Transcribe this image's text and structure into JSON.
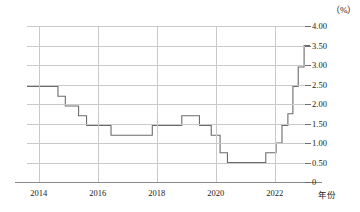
{
  "chart_data": {
    "type": "line",
    "title": "",
    "subtitle": "",
    "xlabel": "年份",
    "ylabel": "",
    "unit_label": "（%）",
    "grid": true,
    "legend": null,
    "line_style": "step",
    "xlim": [
      2013.6,
      2023.2
    ],
    "ylim": [
      0,
      4.0
    ],
    "xticks": [
      "2014",
      "2016",
      "2018",
      "2020",
      "2022"
    ],
    "xtick_values": [
      2014,
      2016,
      2018,
      2020,
      2022
    ],
    "yticks": [
      "0",
      "0.50",
      "1.00",
      "1.50",
      "2.00",
      "2.50",
      "3.00",
      "3.50",
      "4.00"
    ],
    "ytick_values": [
      0,
      0.5,
      1.0,
      1.5,
      2.0,
      2.5,
      3.0,
      3.5,
      4.0
    ],
    "series": [
      {
        "name": "利率",
        "color": "#6b6b6b",
        "x": [
          2013.6,
          2014.65,
          2014.65,
          2014.9,
          2014.9,
          2015.35,
          2015.35,
          2015.62,
          2015.62,
          2016.45,
          2016.45,
          2017.85,
          2017.85,
          2018.85,
          2018.85,
          2019.45,
          2019.45,
          2019.85,
          2019.85,
          2020.15,
          2020.15,
          2020.4,
          2020.4,
          2021.7,
          2021.7,
          2022.05,
          2022.05,
          2022.25,
          2022.25,
          2022.45,
          2022.45,
          2022.62,
          2022.62,
          2022.8,
          2022.8,
          2023.0,
          2023.0,
          2023.2
        ],
        "y": [
          2.45,
          2.45,
          2.2,
          2.2,
          1.95,
          1.95,
          1.7,
          1.7,
          1.45,
          1.45,
          1.2,
          1.2,
          1.45,
          1.45,
          1.7,
          1.7,
          1.45,
          1.45,
          1.2,
          1.2,
          0.75,
          0.75,
          0.5,
          0.5,
          0.75,
          0.75,
          1.0,
          1.0,
          1.45,
          1.45,
          1.75,
          1.75,
          2.45,
          2.45,
          2.95,
          2.95,
          3.5,
          3.5
        ],
        "description": "阶梯状政策利率序列：2014年2.45%逐级下降至2016年1.20%，2019年小幅回升至1.70%，2020年降至0.50%低位，2022年快速上行至3.50%"
      }
    ]
  }
}
